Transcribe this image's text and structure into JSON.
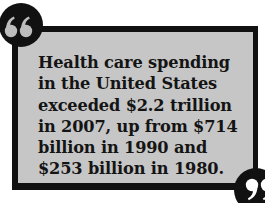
{
  "quote": {
    "lines": [
      "Health care spending",
      "in the United States",
      "exceeded $2.2 trillion",
      "in 2007, up from $714",
      "billion in 1990 and",
      "$253 billion in 1980."
    ],
    "open_mark_icon": "open-quote-icon",
    "close_mark_icon": "close-quote-icon"
  },
  "colors": {
    "box_fill": "#c6c6c6",
    "border": "#111111",
    "text": "#141414",
    "quote_glyph": "#bdbdbd"
  }
}
